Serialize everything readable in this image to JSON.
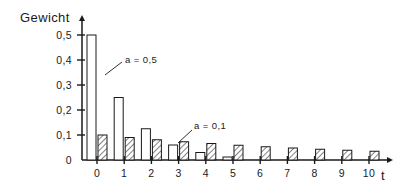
{
  "chart_data": {
    "type": "bar",
    "title": "",
    "ylabel": "Gewicht",
    "xlabel": "t",
    "categories": [
      "0",
      "1",
      "2",
      "3",
      "4",
      "5",
      "6",
      "7",
      "8",
      "9",
      "10"
    ],
    "x": [
      0,
      1,
      2,
      3,
      4,
      5,
      6,
      7,
      8,
      9,
      10
    ],
    "ylim": [
      0,
      0.55
    ],
    "xlim": [
      -0.6,
      10.9
    ],
    "grid": false,
    "legend_position": "inline-annotations",
    "series": [
      {
        "name": "a = 0,5",
        "style": "open",
        "values": [
          0.5,
          0.25,
          0.125,
          0.06,
          0.03,
          0.012,
          0.0,
          0.0,
          0.0,
          0.0,
          0.0
        ]
      },
      {
        "name": "a = 0,1",
        "style": "hatched",
        "values": [
          0.1,
          0.09,
          0.081,
          0.073,
          0.066,
          0.059,
          0.053,
          0.048,
          0.043,
          0.039,
          0.035
        ]
      }
    ],
    "annotations": [
      {
        "text": "a = 0,5",
        "points_to_series": "a = 0,5",
        "points_to_x": 0
      },
      {
        "text": "a = 0,1",
        "points_to_series": "a = 0,1",
        "points_to_x": 3
      }
    ],
    "ytick_labels": [
      "0,5",
      "0,4",
      "0,3",
      "0,2",
      "0,1",
      "0"
    ],
    "ytick_values": [
      0.5,
      0.4,
      0.3,
      0.2,
      0.1,
      0.0
    ],
    "xtick_labels": [
      "0",
      "1",
      "2",
      "3",
      "4",
      "5",
      "6",
      "7",
      "8",
      "9",
      "10"
    ]
  },
  "axes": {
    "y_axis_title": "Gewicht",
    "x_axis_title": "t"
  },
  "colors": {
    "ink": "#1a1a1a",
    "background": "#ffffff",
    "bar_fill_open": "#ffffff",
    "bar_fill_hatched": "#ffffff"
  }
}
